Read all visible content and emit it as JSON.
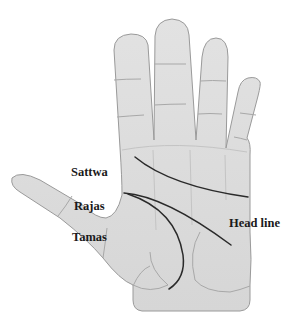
{
  "diagram": {
    "labels": {
      "sattwa": "Sattwa",
      "rajas": "Rajas",
      "tamas": "Tamas",
      "head_line": "Head line"
    },
    "colors": {
      "skin_fill": "#dcdcdc",
      "skin_outline": "#9a9a9a",
      "crease": "#a8a8a8",
      "palm_line": "#2a2a2a",
      "text": "#1a1a1a",
      "background": "#ffffff"
    }
  }
}
